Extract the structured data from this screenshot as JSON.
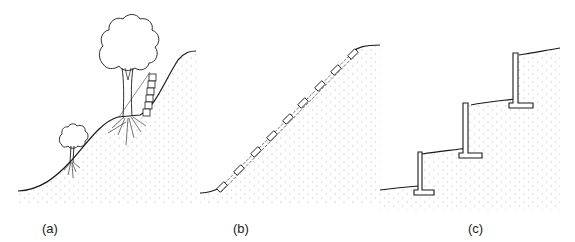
{
  "figure": {
    "panels": [
      {
        "id": "a",
        "label": "(a)",
        "description": "Vegetated natural slope with trees and a small stacked-block wall"
      },
      {
        "id": "b",
        "label": "(b)",
        "description": "Uniform slope reinforced with a line of anchored stakes"
      },
      {
        "id": "c",
        "label": "(c)",
        "description": "Terraced slope with three L-shaped retaining walls"
      }
    ]
  },
  "colors": {
    "line": "#1a1a1a",
    "stipple": "#8a8a8a",
    "background": "#ffffff"
  }
}
